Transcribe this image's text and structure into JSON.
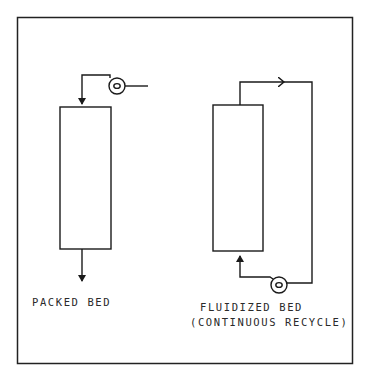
{
  "diagram": {
    "packed_bed": {
      "label": "PACKED BED",
      "components": [
        "pump",
        "column",
        "inlet-arrow",
        "outlet-arrow"
      ]
    },
    "fluidized_bed": {
      "label_line1": "FLUIDIZED BED",
      "label_line2": "(CONTINUOUS RECYCLE)",
      "components": [
        "pump",
        "column",
        "recycle-loop",
        "inlet-arrow",
        "flow-arrow"
      ]
    },
    "colors": {
      "ink": "#1a1a1a",
      "background": "#ffffff"
    }
  }
}
